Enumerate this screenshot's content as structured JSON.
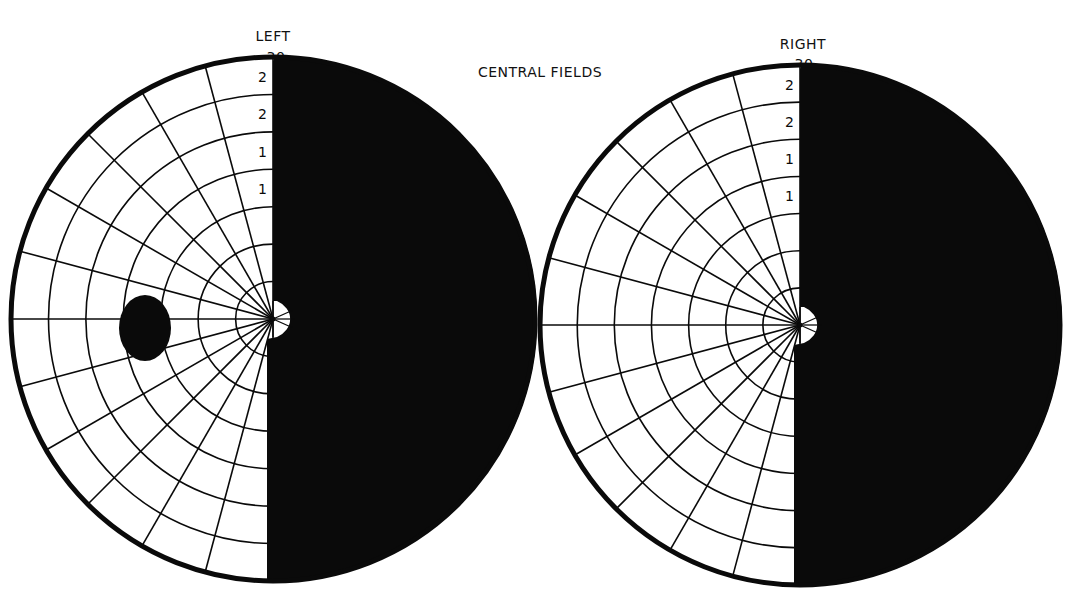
{
  "title": "CENTRAL FIELDS",
  "colors": {
    "background": "#ffffff",
    "ink": "#0a0a0a",
    "field": "#ffffff"
  },
  "chart_data": {
    "type": "diagram",
    "title": "CENTRAL FIELDS",
    "fields": [
      {
        "eye": "LEFT",
        "top_label": "30",
        "center": [
          273,
          319
        ],
        "radius": 262,
        "ring_count": 7,
        "spoke_step_deg": 15,
        "defect": "right half blind (black), macular sparing notch at fixation",
        "ring_labels": [
          "2",
          "2",
          "1",
          "1"
        ],
        "blind_spot": {
          "cx": 145,
          "cy": 328,
          "rx": 26,
          "ry": 33
        }
      },
      {
        "eye": "RIGHT",
        "top_label": "30",
        "center": [
          800,
          325
        ],
        "radius": 260,
        "ring_count": 7,
        "spoke_step_deg": 15,
        "defect": "right half blind (black), macular sparing notch at fixation",
        "ring_labels": [
          "2",
          "2",
          "1",
          "1"
        ],
        "blind_spot": null
      }
    ]
  },
  "labels": {
    "left_eye": "LEFT",
    "left_30": "30",
    "right_eye": "RIGHT",
    "right_30": "30",
    "center_title": "CENTRAL FIELDS"
  },
  "ring_labels_left": [
    "2",
    "2",
    "1",
    "1"
  ],
  "ring_labels_right": [
    "2",
    "2",
    "1",
    "1"
  ]
}
